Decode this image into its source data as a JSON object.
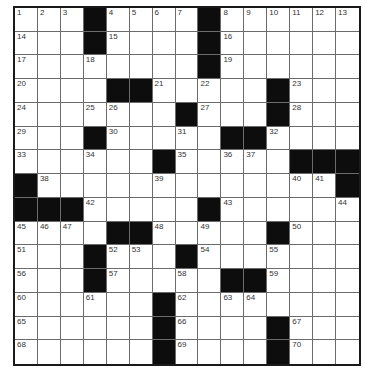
{
  "puzzle": {
    "rows": 15,
    "cols": 15,
    "colors": {
      "black": "#0d0d0d",
      "white": "#ffffff",
      "grid_line": "#6b6b6b",
      "border": "#1a1a1a",
      "number": "#333333"
    },
    "grid": [
      "...#....#......",
      "...#....#......",
      "........#......",
      "....##.....#...",
      ".......#...#...",
      "...#.....##....",
      "......#.....###",
      "#.............#",
      "###.....#......",
      "....##.....#...",
      "...#...#.......",
      "...#.....##....",
      "......#........",
      "......#....#...",
      "......#....#..."
    ],
    "numbers": [
      [
        1,
        2,
        3,
        null,
        4,
        5,
        6,
        7,
        null,
        8,
        9,
        10,
        11,
        12,
        13
      ],
      [
        14,
        null,
        null,
        null,
        15,
        null,
        null,
        null,
        null,
        16,
        null,
        null,
        null,
        null,
        null
      ],
      [
        17,
        null,
        null,
        18,
        null,
        null,
        null,
        null,
        null,
        19,
        null,
        null,
        null,
        null,
        null
      ],
      [
        20,
        null,
        null,
        null,
        null,
        null,
        21,
        null,
        22,
        null,
        null,
        null,
        23,
        null,
        null
      ],
      [
        24,
        null,
        null,
        25,
        26,
        null,
        null,
        null,
        27,
        null,
        null,
        null,
        28,
        null,
        null
      ],
      [
        29,
        null,
        null,
        null,
        30,
        null,
        null,
        31,
        null,
        null,
        null,
        32,
        null,
        null,
        null
      ],
      [
        33,
        null,
        null,
        34,
        null,
        null,
        null,
        35,
        null,
        36,
        37,
        null,
        null,
        null,
        null
      ],
      [
        null,
        38,
        null,
        null,
        null,
        null,
        39,
        null,
        null,
        null,
        null,
        null,
        40,
        41,
        null
      ],
      [
        null,
        null,
        null,
        42,
        null,
        null,
        null,
        null,
        null,
        43,
        null,
        null,
        null,
        null,
        44
      ],
      [
        45,
        46,
        47,
        null,
        null,
        null,
        48,
        null,
        49,
        null,
        null,
        null,
        50,
        null,
        null
      ],
      [
        51,
        null,
        null,
        null,
        52,
        53,
        null,
        null,
        54,
        null,
        null,
        55,
        null,
        null,
        null
      ],
      [
        56,
        null,
        null,
        null,
        57,
        null,
        null,
        58,
        null,
        null,
        null,
        59,
        null,
        null,
        null
      ],
      [
        60,
        null,
        null,
        61,
        null,
        null,
        null,
        62,
        null,
        63,
        64,
        null,
        null,
        null,
        null
      ],
      [
        65,
        null,
        null,
        null,
        null,
        null,
        null,
        66,
        null,
        null,
        null,
        null,
        67,
        null,
        null
      ],
      [
        68,
        null,
        null,
        null,
        null,
        null,
        null,
        69,
        null,
        null,
        null,
        null,
        70,
        null,
        null
      ]
    ],
    "letters": []
  }
}
